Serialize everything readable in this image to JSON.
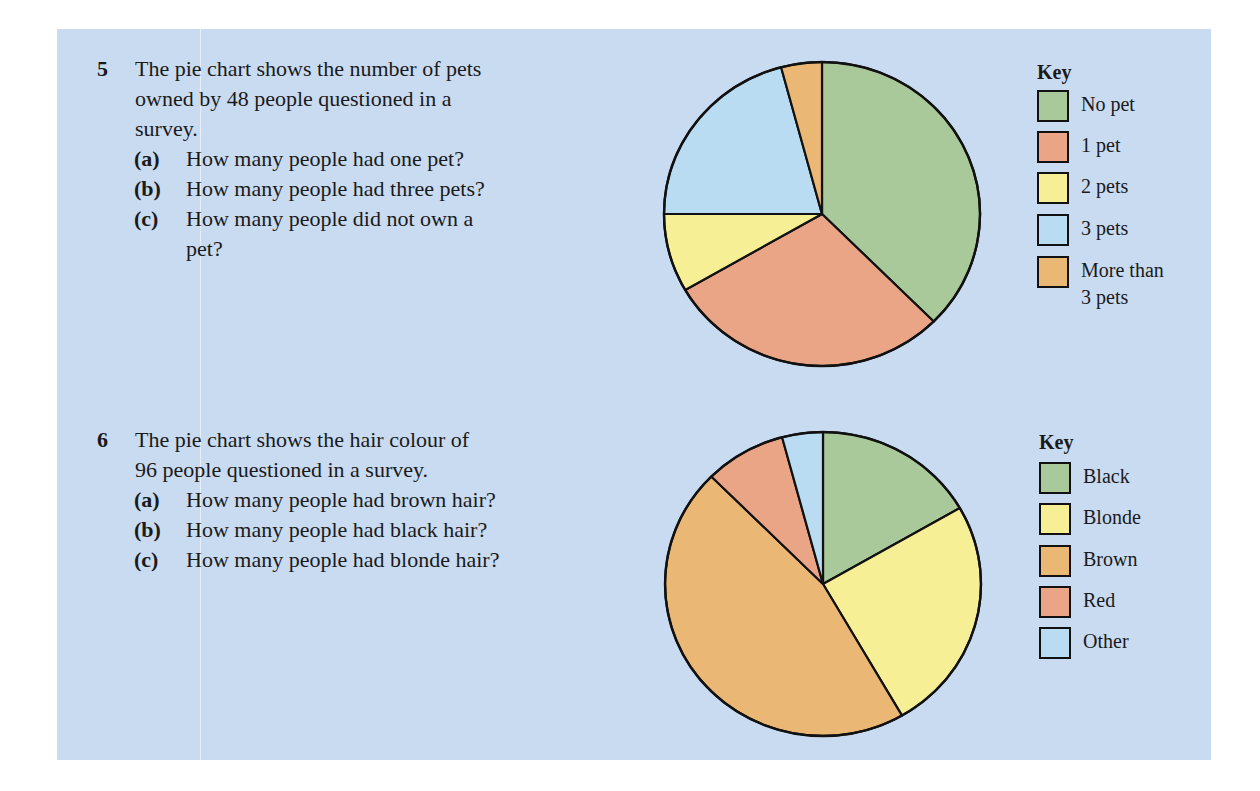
{
  "questions": [
    {
      "number": "5",
      "stem_lines": [
        "The pie chart shows the number of pets",
        "owned by 48 people questioned in a",
        "survey."
      ],
      "parts": [
        {
          "label": "(a)",
          "lines": [
            "How many people had one pet?"
          ]
        },
        {
          "label": "(b)",
          "lines": [
            "How many people had three pets?"
          ]
        },
        {
          "label": "(c)",
          "lines": [
            "How many people did not own a",
            "pet?"
          ]
        }
      ],
      "key": {
        "title": "Key",
        "items": [
          {
            "label": "No pet",
            "color": "#a9c99a"
          },
          {
            "label": "1 pet",
            "color": "#e9a586"
          },
          {
            "label": "2 pets",
            "color": "#f6ef96"
          },
          {
            "label": "3 pets",
            "color": "#b9dcf3"
          },
          {
            "label": "More than",
            "label2": "3 pets",
            "color": "#ebb775"
          }
        ]
      }
    },
    {
      "number": "6",
      "stem_lines": [
        "The pie chart shows the hair colour of",
        "96 people questioned in a survey."
      ],
      "parts": [
        {
          "label": "(a)",
          "lines": [
            "How many people had brown hair?"
          ]
        },
        {
          "label": "(b)",
          "lines": [
            "How many people had black hair?"
          ]
        },
        {
          "label": "(c)",
          "lines": [
            "How many people had blonde hair?"
          ]
        }
      ],
      "key": {
        "title": "Key",
        "items": [
          {
            "label": "Black",
            "color": "#a9c99a"
          },
          {
            "label": "Blonde",
            "color": "#f6ef96"
          },
          {
            "label": "Brown",
            "color": "#ebb775"
          },
          {
            "label": "Red",
            "color": "#e9a586"
          },
          {
            "label": "Other",
            "color": "#b9dcf3"
          }
        ]
      }
    }
  ],
  "chart_data": [
    {
      "type": "pie",
      "title": "Number of pets owned by 48 people",
      "total": 48,
      "categories": [
        "No pet",
        "1 pet",
        "2 pets",
        "3 pets",
        "More than 3 pets"
      ],
      "values": [
        18,
        14,
        4,
        10,
        2
      ],
      "angles_deg": [
        135,
        105,
        30,
        75,
        15
      ],
      "colors": [
        "#a9c99a",
        "#e9a586",
        "#f6ef96",
        "#b9dcf3",
        "#ebb775"
      ],
      "start_angle": "12 o'clock, clockwise",
      "legend_title": "Key",
      "legend_position": "right"
    },
    {
      "type": "pie",
      "title": "Hair colour of 96 people",
      "total": 96,
      "categories": [
        "Black",
        "Blonde",
        "Brown",
        "Red",
        "Other"
      ],
      "values": [
        16,
        24,
        44,
        8,
        4
      ],
      "angles_deg": [
        60,
        90,
        165,
        30,
        15
      ],
      "colors": [
        "#a9c99a",
        "#f6ef96",
        "#ebb775",
        "#e9a586",
        "#b9dcf3"
      ],
      "start_angle": "12 o'clock, clockwise",
      "legend_title": "Key",
      "legend_position": "right"
    }
  ]
}
